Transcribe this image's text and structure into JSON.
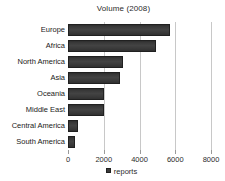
{
  "chart_data": {
    "type": "bar",
    "orientation": "horizontal",
    "title": "Volume (2008)",
    "xlabel": "",
    "ylabel": "",
    "categories": [
      "Europe",
      "Africa",
      "North America",
      "Asia",
      "Oceania",
      "Middle East",
      "Central America",
      "South America"
    ],
    "values": [
      5700,
      4950,
      3100,
      2900,
      2000,
      2000,
      560,
      410
    ],
    "series": [
      {
        "name": "reports",
        "values": [
          5700,
          4950,
          3100,
          2900,
          2000,
          2000,
          560,
          410
        ]
      }
    ],
    "xlim": [
      0,
      8000
    ],
    "xticks": [
      0,
      2000,
      4000,
      6000,
      8000
    ],
    "xtick_labels": [
      "0",
      "2000",
      "4000",
      "6000",
      "8000"
    ],
    "grid": true,
    "legend": {
      "position": "bottom",
      "entries": [
        "reports"
      ]
    },
    "colors": {
      "bar": "#3a3a3a",
      "bar_edge": "#202020",
      "gridline": "#c8c8c8",
      "text": "#1a1a1a",
      "background": "#ffffff"
    }
  }
}
